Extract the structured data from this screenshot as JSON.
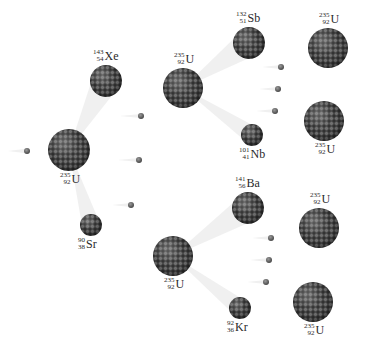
{
  "diagram": {
    "type": "nuclear-fission-chain-reaction",
    "nuclei": [
      {
        "id": "u-initial",
        "mass": "235",
        "atomic": "92",
        "symbol": "U",
        "cx": 69,
        "cy": 150,
        "r": 21,
        "label_pos": "below"
      },
      {
        "id": "xe",
        "mass": "143",
        "atomic": "54",
        "symbol": "Xe",
        "cx": 106,
        "cy": 81,
        "r": 16,
        "label_pos": "above"
      },
      {
        "id": "sr",
        "mass": "90",
        "atomic": "38",
        "symbol": "Sr",
        "cx": 91,
        "cy": 225,
        "r": 11,
        "label_pos": "below"
      },
      {
        "id": "u-gen2-top",
        "mass": "235",
        "atomic": "92",
        "symbol": "U",
        "cx": 183,
        "cy": 88,
        "r": 20,
        "label_pos": "above"
      },
      {
        "id": "u-gen2-bottom",
        "mass": "235",
        "atomic": "92",
        "symbol": "U",
        "cx": 173,
        "cy": 256,
        "r": 20,
        "label_pos": "below"
      },
      {
        "id": "sb",
        "mass": "132",
        "atomic": "51",
        "symbol": "Sb",
        "cx": 249,
        "cy": 43,
        "r": 16,
        "label_pos": "above"
      },
      {
        "id": "nb",
        "mass": "101",
        "atomic": "41",
        "symbol": "Nb",
        "cx": 252,
        "cy": 135,
        "r": 11,
        "label_pos": "below"
      },
      {
        "id": "ba",
        "mass": "141",
        "atomic": "56",
        "symbol": "Ba",
        "cx": 248,
        "cy": 208,
        "r": 16,
        "label_pos": "above"
      },
      {
        "id": "kr",
        "mass": "92",
        "atomic": "36",
        "symbol": "Kr",
        "cx": 240,
        "cy": 308,
        "r": 11,
        "label_pos": "below"
      },
      {
        "id": "u-gen3-1",
        "mass": "235",
        "atomic": "92",
        "symbol": "U",
        "cx": 328,
        "cy": 48,
        "r": 20,
        "label_pos": "above"
      },
      {
        "id": "u-gen3-2",
        "mass": "235",
        "atomic": "92",
        "symbol": "U",
        "cx": 324,
        "cy": 121,
        "r": 20,
        "label_pos": "below"
      },
      {
        "id": "u-gen3-3",
        "mass": "235",
        "atomic": "92",
        "symbol": "U",
        "cx": 319,
        "cy": 228,
        "r": 20,
        "label_pos": "above"
      },
      {
        "id": "u-gen3-4",
        "mass": "235",
        "atomic": "92",
        "symbol": "U",
        "cx": 313,
        "cy": 302,
        "r": 20,
        "label_pos": "below"
      }
    ],
    "neutrons": [
      {
        "id": "n-incoming",
        "cx": 27,
        "cy": 151
      },
      {
        "id": "n-gen1-a",
        "cx": 141,
        "cy": 116
      },
      {
        "id": "n-gen1-b",
        "cx": 139,
        "cy": 160
      },
      {
        "id": "n-gen1-c",
        "cx": 131,
        "cy": 205
      },
      {
        "id": "n-gen2-top-a",
        "cx": 281,
        "cy": 67
      },
      {
        "id": "n-gen2-top-b",
        "cx": 278,
        "cy": 89
      },
      {
        "id": "n-gen2-top-c",
        "cx": 275,
        "cy": 111
      },
      {
        "id": "n-gen2-bot-a",
        "cx": 271,
        "cy": 238
      },
      {
        "id": "n-gen2-bot-b",
        "cx": 269,
        "cy": 260
      },
      {
        "id": "n-gen2-bot-c",
        "cx": 266,
        "cy": 282
      }
    ]
  }
}
